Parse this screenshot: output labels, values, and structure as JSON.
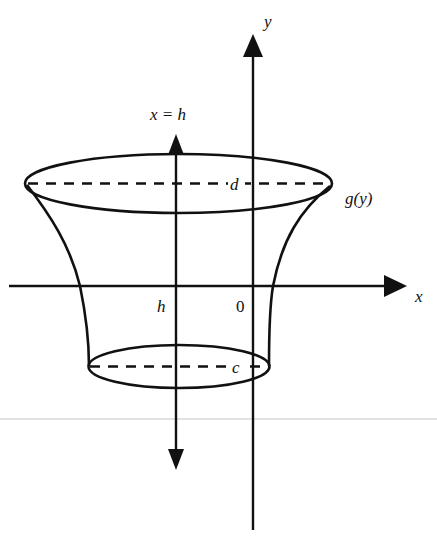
{
  "figure": {
    "labels": {
      "y_axis": "y",
      "x_axis": "x",
      "rotation_axis": "x = h",
      "upper_bound": "d",
      "lower_bound": "c",
      "curve": "g(y)",
      "h_tick": "h",
      "origin": "0"
    },
    "colors": {
      "ink": "#111111",
      "background": "#ffffff",
      "scan_artifact": "#d8d8d8"
    }
  }
}
